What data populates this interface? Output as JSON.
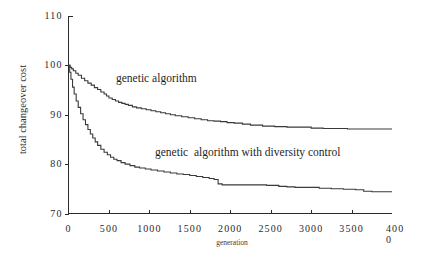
{
  "chart_data": {
    "type": "line",
    "title": "",
    "xlabel": "generation",
    "ylabel": "total changeover cost",
    "xlim": [
      0,
      4000
    ],
    "ylim": [
      70,
      110
    ],
    "grid": false,
    "legend_position": "inline-annotation",
    "xticks": [
      {
        "value": 0,
        "label": "0"
      },
      {
        "value": 500,
        "label": "500"
      },
      {
        "value": 1000,
        "label": "1000"
      },
      {
        "value": 1500,
        "label": "1500"
      },
      {
        "value": 2000,
        "label": "2000"
      },
      {
        "value": 2500,
        "label": "2500"
      },
      {
        "value": 3000,
        "label": "3000"
      },
      {
        "value": 3500,
        "label": "3500"
      },
      {
        "value": 4000,
        "label": "4000"
      }
    ],
    "yticks": [
      {
        "value": 110,
        "label": "110"
      },
      {
        "value": 100,
        "label": "100"
      },
      {
        "value": 90,
        "label": "90"
      },
      {
        "value": 80,
        "label": "80"
      },
      {
        "value": 70,
        "label": "70"
      }
    ],
    "series": [
      {
        "name": "genetic algorithm",
        "annotation": "genetic algorithm",
        "color": "#3a3a3a",
        "x": [
          0,
          20,
          40,
          60,
          90,
          120,
          160,
          200,
          240,
          280,
          320,
          360,
          400,
          440,
          470,
          500,
          540,
          580,
          620,
          660,
          700,
          740,
          790,
          840,
          900,
          960,
          1020,
          1080,
          1140,
          1200,
          1260,
          1320,
          1400,
          1480,
          1560,
          1640,
          1720,
          1800,
          1880,
          1960,
          2050,
          2150,
          2250,
          2400,
          2550,
          2700,
          2850,
          3000,
          3150,
          3300,
          3450,
          3600,
          3750,
          3900,
          4000
        ],
        "y": [
          100.0,
          99.6,
          99.3,
          98.9,
          98.4,
          98.0,
          97.4,
          96.9,
          96.4,
          96.0,
          95.5,
          95.1,
          94.6,
          94.2,
          93.8,
          93.4,
          93.1,
          92.8,
          92.5,
          92.3,
          92.1,
          91.9,
          91.6,
          91.4,
          91.2,
          91.0,
          90.8,
          90.6,
          90.4,
          90.2,
          90.0,
          89.8,
          89.6,
          89.4,
          89.2,
          89.0,
          88.8,
          88.7,
          88.6,
          88.4,
          88.3,
          88.1,
          87.9,
          87.7,
          87.6,
          87.5,
          87.5,
          87.3,
          87.2,
          87.2,
          87.1,
          87.1,
          87.1,
          87.1,
          87.1
        ]
      },
      {
        "name": "genetic algorithm with diversity control",
        "annotation": "genetic  algorithm with diversity control",
        "color": "#3a3a3a",
        "x": [
          0,
          15,
          30,
          50,
          70,
          95,
          120,
          150,
          180,
          210,
          240,
          270,
          300,
          330,
          360,
          400,
          440,
          480,
          520,
          560,
          600,
          650,
          700,
          760,
          820,
          880,
          950,
          1020,
          1100,
          1180,
          1260,
          1340,
          1420,
          1500,
          1580,
          1660,
          1740,
          1800,
          1850,
          1900,
          2000,
          2150,
          2300,
          2450,
          2600,
          2700,
          2800,
          2950,
          3100,
          3250,
          3400,
          3550,
          3650,
          3750,
          3900,
          4000
        ],
        "y": [
          100.0,
          98.6,
          97.2,
          95.6,
          94.2,
          92.8,
          91.5,
          90.2,
          89.0,
          88.0,
          87.0,
          86.1,
          85.3,
          84.5,
          83.8,
          83.0,
          82.4,
          81.9,
          81.4,
          81.0,
          80.7,
          80.3,
          80.0,
          79.7,
          79.4,
          79.2,
          79.0,
          78.8,
          78.6,
          78.4,
          78.2,
          78.0,
          77.9,
          77.7,
          77.5,
          77.3,
          77.1,
          76.9,
          76.0,
          75.8,
          75.8,
          75.8,
          75.8,
          75.7,
          75.5,
          75.4,
          75.3,
          75.3,
          75.1,
          75.0,
          74.9,
          74.8,
          74.5,
          74.4,
          74.4,
          74.4
        ]
      }
    ]
  },
  "figure": {
    "annotations": {
      "series1": "genetic algorithm",
      "series2": "genetic  algorithm with diversity control"
    },
    "axis_titles": {
      "x": "generation",
      "y": "total changeover cost"
    },
    "xtick_wrapped_last": {
      "head": "400",
      "tail": "0"
    }
  }
}
